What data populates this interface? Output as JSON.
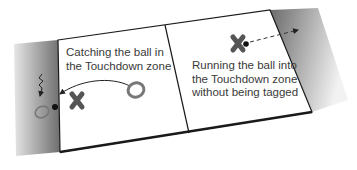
{
  "diagram": {
    "left_zone": {
      "caption_lines": [
        "Catching the ball in",
        "the Touchdown zone"
      ]
    },
    "right_zone": {
      "caption_lines": [
        "Running the ball into",
        "the Touchdown zone",
        "without being tagged"
      ]
    },
    "icons": {
      "left_receiver": "ring-player-icon",
      "left_defender": "x-player-icon",
      "left_catcher": "ring-player-icon",
      "ball": "ball-dot-icon",
      "right_runner": "x-player-icon"
    },
    "colors": {
      "field": "#ffffff",
      "endzone_dark": "#7a7a7a",
      "endzone_light": "#e8e8e8",
      "lines": "#1a1a1a",
      "marker": "#555555"
    }
  }
}
